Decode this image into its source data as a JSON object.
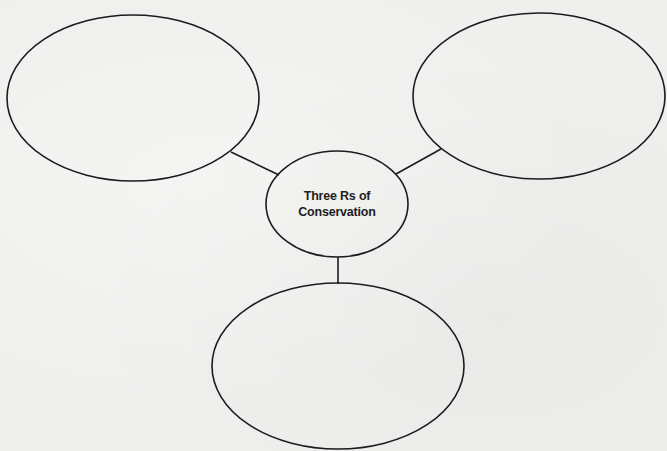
{
  "diagram": {
    "type": "concept-web",
    "center": {
      "line1": "Three Rs of",
      "line2": "Conservation"
    },
    "nodes": [
      {
        "id": "top-left",
        "label": ""
      },
      {
        "id": "top-right",
        "label": ""
      },
      {
        "id": "bottom",
        "label": ""
      }
    ],
    "colors": {
      "stroke": "#1c1c1c",
      "background": "#efefed",
      "text": "#1e1e1e"
    }
  }
}
